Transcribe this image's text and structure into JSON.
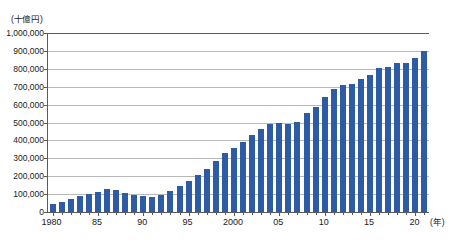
{
  "chart_data": {
    "type": "bar",
    "title": "",
    "subtitle": "",
    "xlabel": "(年)",
    "ylabel": "(十億円)",
    "unit_note": "(十億円)",
    "x_unit_note": "(年)",
    "ylim": [
      0,
      1000000
    ],
    "y_tick_step": 100000,
    "grid": true,
    "legend": "none",
    "series_color": "#2d5ba6",
    "y_ticks": [
      "0",
      "100,000",
      "200,000",
      "300,000",
      "400,000",
      "500,000",
      "600,000",
      "700,000",
      "800,000",
      "900,000",
      "1,000,000"
    ],
    "y_tick_values": [
      0,
      100000,
      200000,
      300000,
      400000,
      500000,
      600000,
      700000,
      800000,
      900000,
      1000000
    ],
    "x_tick_labels": [
      {
        "label": "1980",
        "year": 1980
      },
      {
        "label": "85",
        "year": 1985
      },
      {
        "label": "90",
        "year": 1990
      },
      {
        "label": "95",
        "year": 1995
      },
      {
        "label": "2000",
        "year": 2000
      },
      {
        "label": "05",
        "year": 2005
      },
      {
        "label": "10",
        "year": 2010
      },
      {
        "label": "15",
        "year": 2015
      },
      {
        "label": "20",
        "year": 2020
      }
    ],
    "categories": [
      "1980",
      "1981",
      "1982",
      "1983",
      "1984",
      "1985",
      "1986",
      "1987",
      "1988",
      "1989",
      "1990",
      "1991",
      "1992",
      "1993",
      "1994",
      "1995",
      "1996",
      "1997",
      "1998",
      "1999",
      "2000",
      "2001",
      "2002",
      "2003",
      "2004",
      "2005",
      "2006",
      "2007",
      "2008",
      "2009",
      "2010",
      "2011",
      "2012",
      "2013",
      "2014",
      "2015",
      "2016",
      "2017",
      "2018",
      "2019",
      "2020",
      "2021"
    ],
    "values": [
      45000,
      57000,
      72000,
      88000,
      101000,
      112000,
      127000,
      123000,
      109000,
      96000,
      87000,
      83000,
      97000,
      115000,
      146000,
      175000,
      204000,
      238000,
      285000,
      329000,
      356000,
      390000,
      431000,
      463000,
      492000,
      495000,
      494000,
      503000,
      551000,
      589000,
      644000,
      688000,
      710000,
      717000,
      742000,
      767000,
      806000,
      810000,
      832000,
      835000,
      863000,
      899000
    ]
  }
}
